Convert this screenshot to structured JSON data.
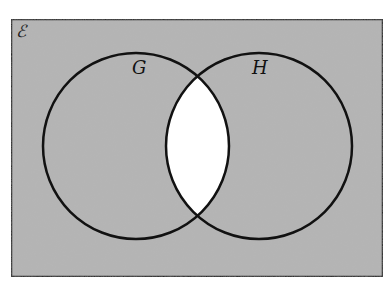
{
  "diagram": {
    "type": "venn",
    "universal_set_label": "ℰ",
    "sets": [
      {
        "label": "G"
      },
      {
        "label": "H"
      }
    ],
    "shaded_region": "(G ∩ H)'",
    "unshaded_region": "G ∩ H",
    "colors": {
      "shade": "#b4b4b4",
      "unshaded": "#ffffff",
      "stroke": "#111111"
    }
  }
}
